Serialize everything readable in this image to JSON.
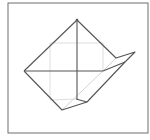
{
  "diagram": {
    "type": "geometric-fold-figure",
    "colors": {
      "background": "#ffffff",
      "frame": "#6e6e6e",
      "main_line": "#555555",
      "grid_line": "#d4d4d4",
      "faint_line": "#c8c8c8"
    },
    "frame": {
      "x": 8,
      "y": 3,
      "width": 140,
      "height": 130
    },
    "grid_square": {
      "x": 50,
      "y": 43,
      "width": 53,
      "height": 57
    },
    "vertices": {
      "top": [
        77,
        20
      ],
      "left": [
        24,
        71
      ],
      "bottom": [
        62,
        110
      ],
      "notch": [
        116,
        58
      ],
      "tip": [
        135,
        52
      ],
      "inner_right": [
        125,
        62
      ],
      "mid_right": [
        103,
        71
      ],
      "lower_right": [
        87,
        102
      ],
      "bottom_center": [
        76,
        99
      ]
    }
  }
}
